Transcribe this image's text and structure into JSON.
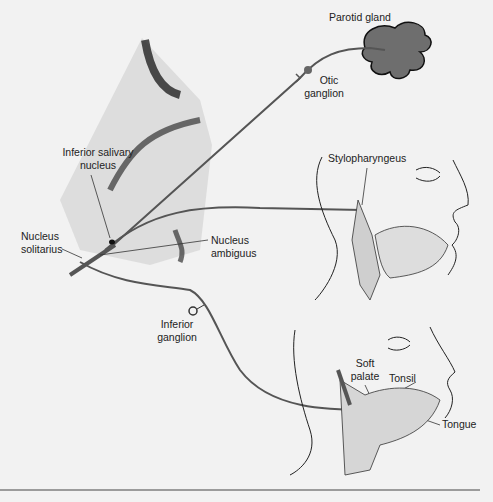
{
  "figure": {
    "labels": {
      "parotid_gland": "Parotid gland",
      "otic_ganglion_1": "Otic",
      "otic_ganglion_2": "ganglion",
      "inferior_salivary_1": "Inferior salivary",
      "inferior_salivary_2": "nucleus",
      "stylopharyngeus": "Stylopharyngeus",
      "nucleus_solitarius_1": "Nucleus",
      "nucleus_solitarius_2": "solitarius",
      "nucleus_ambiguus_1": "Nucleus",
      "nucleus_ambiguus_2": "ambiguus",
      "inferior_ganglion_1": "Inferior",
      "inferior_ganglion_2": "ganglion",
      "soft_palate_1": "Soft",
      "soft_palate_2": "palate",
      "tonsil": "Tonsil",
      "tongue": "Tongue"
    },
    "colors": {
      "background": "#f2f2f2",
      "nerve": "#555555",
      "gland_fill": "#6e6e6e",
      "outline": "#1a1a1a"
    }
  }
}
